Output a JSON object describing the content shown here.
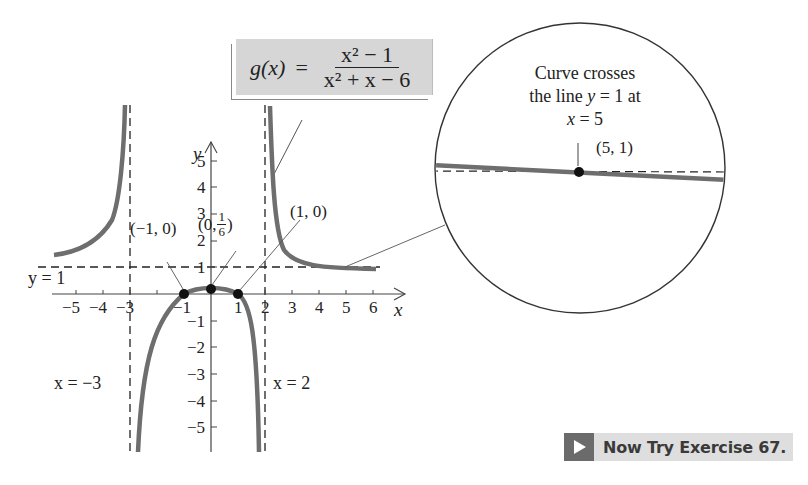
{
  "formula": {
    "lhs": "g(x)",
    "equals": "=",
    "numerator": "x² − 1",
    "denominator": "x² + x − 6"
  },
  "graph": {
    "x_axis_label": "x",
    "y_axis_label": "y",
    "x_ticks": [
      "−5",
      "−4",
      "−3",
      "−1",
      "1",
      "2",
      "3",
      "4",
      "5",
      "6"
    ],
    "y_ticks": [
      "5",
      "4",
      "3",
      "2",
      "1",
      "−1",
      "−2",
      "−3",
      "−4",
      "−5"
    ],
    "asymptotes": {
      "horizontal": "y = 1",
      "vertical_left": "x = −3",
      "vertical_right": "x = 2"
    },
    "points": [
      {
        "label": "(−1, 0)"
      },
      {
        "label": "(0, 1/6)",
        "prefix": "(0, ",
        "num": "1",
        "den": "6",
        "suffix": ")"
      },
      {
        "label": "(1, 0)"
      }
    ]
  },
  "zoom_callout": {
    "line1": "Curve crosses",
    "line2_pre": "the line ",
    "line2_var": "y",
    "line2_post": " = 1 at",
    "line3_var": "x",
    "line3_post": " = 5",
    "point_label": "(5, 1)"
  },
  "exercise_button": {
    "label": "Now Try Exercise 67.",
    "icon": "play-arrow-icon"
  },
  "colors": {
    "curve": "#6e6e6e",
    "formula_bg": "#d6d6d6",
    "button_bg": "#dedede",
    "button_icon_bg": "#6b6b6b",
    "text": "#222222"
  }
}
